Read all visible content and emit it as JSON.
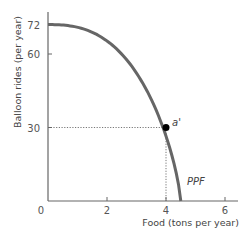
{
  "chart_data": {
    "type": "line",
    "title": "",
    "xlabel": "Food (tons per year)",
    "ylabel": "Balloon rides (per year)",
    "xlim": [
      0,
      6.5
    ],
    "ylim": [
      0,
      78
    ],
    "x_ticks": [
      0,
      2,
      4,
      6
    ],
    "y_ticks": [
      30,
      60,
      72
    ],
    "x_tick_labels": [
      "0",
      "2",
      "4",
      "6"
    ],
    "y_tick_labels": [
      "30",
      "60",
      "72"
    ],
    "grid": false,
    "series": [
      {
        "name": "PPF",
        "label": "PPF",
        "color": "#666666",
        "points": [
          [
            0,
            72
          ],
          [
            1,
            70
          ],
          [
            2,
            63
          ],
          [
            3,
            50
          ],
          [
            4,
            30
          ],
          [
            4.5,
            0
          ]
        ]
      }
    ],
    "highlight_point": {
      "label": "a'",
      "x": 4,
      "y": 30,
      "color": "#000000"
    },
    "guide_lines": {
      "style": "dotted",
      "to_point": "a'"
    }
  }
}
